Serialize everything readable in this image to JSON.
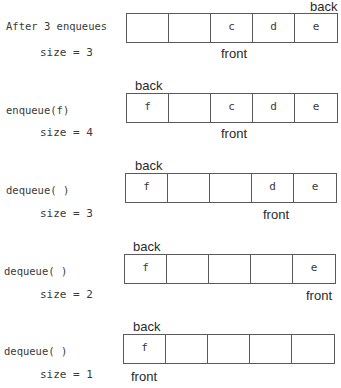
{
  "steps": [
    {
      "operation": "After 3 enqueues",
      "size_label": "size = 3",
      "cells": [
        "",
        "",
        "c",
        "d",
        "e"
      ],
      "back_label": "back",
      "back_index": 4,
      "front_label": "front",
      "front_index": 2
    },
    {
      "operation": "enqueue(f)",
      "size_label": "size = 4",
      "cells": [
        "f",
        "",
        "c",
        "d",
        "e"
      ],
      "back_label": "back",
      "back_index": 0,
      "front_label": "front",
      "front_index": 2
    },
    {
      "operation": "dequeue( )",
      "size_label": "size = 3",
      "cells": [
        "f",
        "",
        "",
        "d",
        "e"
      ],
      "back_label": "back",
      "back_index": 0,
      "front_label": "front",
      "front_index": 3
    },
    {
      "operation": "dequeue( )",
      "size_label": "size = 2",
      "cells": [
        "f",
        "",
        "",
        "",
        "e"
      ],
      "back_label": "back",
      "back_index": 0,
      "front_label": "front",
      "front_index": 4
    },
    {
      "operation": "dequeue( )",
      "size_label": "size = 1",
      "cells": [
        "f",
        "",
        "",
        "",
        ""
      ],
      "back_label": "back",
      "back_index": 0,
      "front_label": "front",
      "front_index": 0
    }
  ]
}
